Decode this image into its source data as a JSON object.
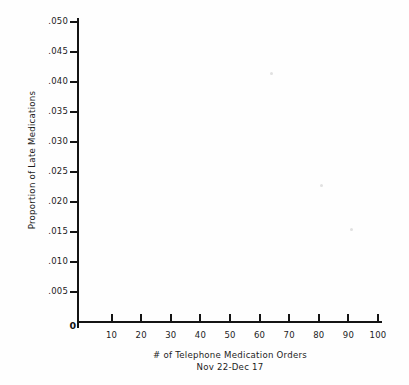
{
  "chart_data": {
    "type": "scatter",
    "title": "",
    "subtitle": "",
    "xlabel": "# of Telephone Medication Orders",
    "xlabel_line2": "Nov 22-Dec 17",
    "ylabel": "Proportion of Late Medications",
    "xlim": [
      0,
      100
    ],
    "ylim": [
      0,
      0.05
    ],
    "grid": false,
    "legend": false,
    "origin_label": "0",
    "x_ticks": [
      {
        "value": 10,
        "label": "10"
      },
      {
        "value": 20,
        "label": "20"
      },
      {
        "value": 30,
        "label": "30"
      },
      {
        "value": 40,
        "label": "40"
      },
      {
        "value": 50,
        "label": "50"
      },
      {
        "value": 60,
        "label": "60"
      },
      {
        "value": 70,
        "label": "70"
      },
      {
        "value": 80,
        "label": "80"
      },
      {
        "value": 90,
        "label": "90"
      },
      {
        "value": 100,
        "label": "100"
      }
    ],
    "y_ticks": [
      {
        "value": 0.005,
        "label": ".005"
      },
      {
        "value": 0.01,
        "label": ".010"
      },
      {
        "value": 0.015,
        "label": ".015"
      },
      {
        "value": 0.02,
        "label": ".020"
      },
      {
        "value": 0.025,
        "label": ".025"
      },
      {
        "value": 0.03,
        "label": ".030"
      },
      {
        "value": 0.035,
        "label": ".035"
      },
      {
        "value": 0.04,
        "label": ".040"
      },
      {
        "value": 0.045,
        "label": ".045"
      },
      {
        "value": 0.05,
        "label": ".050"
      }
    ],
    "points": [
      {
        "x": 64,
        "y": 0.0415
      },
      {
        "x": 81,
        "y": 0.0228
      },
      {
        "x": 91,
        "y": 0.0155
      }
    ],
    "point_color": "#b9b9b9",
    "axis_color": "#141414"
  }
}
